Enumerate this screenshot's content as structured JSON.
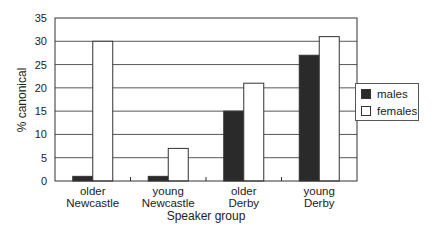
{
  "chart_data": {
    "type": "bar",
    "title": "",
    "xlabel": "Speaker group",
    "ylabel": "% canonical",
    "ylim": [
      0,
      35
    ],
    "yticks": [
      0,
      5,
      10,
      15,
      20,
      25,
      30,
      35
    ],
    "grid": true,
    "legend_position": "right",
    "categories": [
      "older Newcastle",
      "young Newcastle",
      "older Derby",
      "young Derby"
    ],
    "category_lines": [
      [
        "older",
        "Newcastle"
      ],
      [
        "young",
        "Newcastle"
      ],
      [
        "older",
        "Derby"
      ],
      [
        "young",
        "Derby"
      ]
    ],
    "series": [
      {
        "name": "males",
        "color": "#2a2a2a",
        "values": [
          1,
          1,
          15,
          27
        ]
      },
      {
        "name": "females",
        "color": "#ffffff",
        "values": [
          30,
          7,
          21,
          31
        ]
      }
    ]
  },
  "legend": {
    "males_label": "males",
    "females_label": "females"
  },
  "axes": {
    "xlabel": "Speaker group",
    "ylabel": "% canonical"
  }
}
